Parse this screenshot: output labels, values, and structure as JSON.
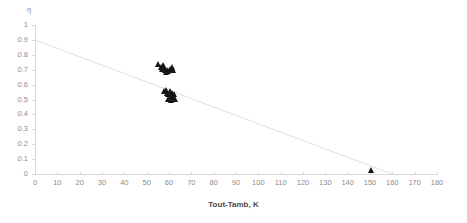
{
  "chart_data": {
    "type": "scatter",
    "title": "",
    "xlabel": "Tout-Tamb, K",
    "ylabel": "η",
    "xlim": [
      0,
      180
    ],
    "ylim": [
      0,
      1
    ],
    "xticks": [
      0,
      10,
      20,
      30,
      40,
      50,
      60,
      70,
      80,
      90,
      100,
      110,
      120,
      130,
      140,
      150,
      160,
      170,
      180
    ],
    "xtick_labels": [
      "0",
      "10",
      "20",
      "30",
      "40",
      "50",
      "60",
      "70",
      "80",
      "90",
      "100",
      "110",
      "120",
      "130",
      "140",
      "150",
      "160",
      "170",
      "180"
    ],
    "yticks": [
      0,
      0.1,
      0.2,
      0.3,
      0.4,
      0.5,
      0.6,
      0.7,
      0.8,
      0.9,
      1
    ],
    "ytick_labels": [
      "0",
      "0.1",
      "0.2",
      "0.3",
      "0.4",
      "0.5",
      "0.6",
      "0.7",
      "0.8",
      "0.9",
      "1"
    ],
    "grid": false,
    "legend": "none",
    "marker_shape": "triangle",
    "marker_color": "#151515",
    "trendline": {
      "type": "line",
      "color": "#e2e2e2",
      "x": [
        0,
        180
      ],
      "y": [
        0.9,
        -0.11
      ],
      "slope": -0.0056,
      "intercept": 0.9,
      "x_at_zero": 160
    },
    "series": [
      {
        "name": "efficiency",
        "points": [
          {
            "x": 55.5,
            "y": 0.735
          },
          {
            "x": 56.5,
            "y": 0.72
          },
          {
            "x": 57.5,
            "y": 0.73
          },
          {
            "x": 57.0,
            "y": 0.705
          },
          {
            "x": 58.0,
            "y": 0.715
          },
          {
            "x": 58.5,
            "y": 0.7
          },
          {
            "x": 59.5,
            "y": 0.7
          },
          {
            "x": 60.5,
            "y": 0.705
          },
          {
            "x": 61.5,
            "y": 0.715
          },
          {
            "x": 62.0,
            "y": 0.695
          },
          {
            "x": 59.0,
            "y": 0.685
          },
          {
            "x": 60.0,
            "y": 0.69
          },
          {
            "x": 58.0,
            "y": 0.555
          },
          {
            "x": 59.0,
            "y": 0.565
          },
          {
            "x": 59.5,
            "y": 0.545
          },
          {
            "x": 60.0,
            "y": 0.535
          },
          {
            "x": 60.5,
            "y": 0.555
          },
          {
            "x": 61.0,
            "y": 0.525
          },
          {
            "x": 61.5,
            "y": 0.545
          },
          {
            "x": 62.0,
            "y": 0.515
          },
          {
            "x": 62.5,
            "y": 0.535
          },
          {
            "x": 63.0,
            "y": 0.505
          },
          {
            "x": 60.0,
            "y": 0.5
          },
          {
            "x": 61.0,
            "y": 0.495
          },
          {
            "x": 150.5,
            "y": 0.025
          }
        ]
      }
    ]
  }
}
